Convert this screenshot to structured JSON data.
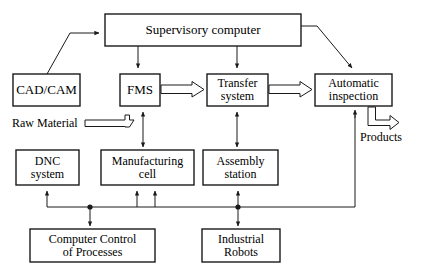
{
  "diagram": {
    "stroke_color": "#1a1a1a",
    "fill_color": "#ffffff",
    "nodes": [
      {
        "id": "supervisory",
        "label": "Supervisory computer",
        "x": 105,
        "y": 14,
        "w": 196,
        "h": 32,
        "font_size": 13
      },
      {
        "id": "cadcam",
        "label": "CAD/CAM",
        "x": 13,
        "y": 74,
        "w": 67,
        "h": 32,
        "font_size": 13
      },
      {
        "id": "fms",
        "label": "FMS",
        "x": 120,
        "y": 74,
        "w": 40,
        "h": 32,
        "font_size": 13
      },
      {
        "id": "transfer",
        "label": "Transfer\nsystem",
        "x": 207,
        "y": 74,
        "w": 61,
        "h": 32,
        "font_size": 12
      },
      {
        "id": "inspection",
        "label": "Automatic\ninspection",
        "x": 315,
        "y": 74,
        "w": 77,
        "h": 32,
        "font_size": 12
      },
      {
        "id": "dnc",
        "label": "DNC\nsystem",
        "x": 16,
        "y": 150,
        "w": 63,
        "h": 35,
        "font_size": 12
      },
      {
        "id": "mfgcell",
        "label": "Manufacturing\ncell",
        "x": 101,
        "y": 150,
        "w": 93,
        "h": 35,
        "font_size": 12
      },
      {
        "id": "assembly",
        "label": "Assembly\nstation",
        "x": 203,
        "y": 150,
        "w": 75,
        "h": 35,
        "font_size": 12
      },
      {
        "id": "ccp",
        "label": "Computer Control\nof Processes",
        "x": 30,
        "y": 229,
        "w": 125,
        "h": 33,
        "font_size": 12
      },
      {
        "id": "robots",
        "label": "Industrial\nRobots",
        "x": 202,
        "y": 229,
        "w": 78,
        "h": 33,
        "font_size": 12
      }
    ],
    "free_labels": [
      {
        "id": "raw-material",
        "text": "Raw Material",
        "x": 12,
        "y": 116,
        "font_size": 12
      },
      {
        "id": "products",
        "text": "Products",
        "x": 360,
        "y": 130,
        "font_size": 12
      }
    ],
    "flow_arrows": [
      {
        "id": "fms-to-transfer",
        "from": "fms",
        "to": "transfer"
      },
      {
        "id": "transfer-to-inspection",
        "from": "transfer",
        "to": "inspection"
      },
      {
        "id": "raw-material-to-fms",
        "from": "raw-material",
        "to": "fms"
      },
      {
        "id": "inspection-to-products",
        "from": "inspection",
        "to": "products"
      }
    ],
    "signal_links": [
      {
        "id": "cadcam-to-supervisory",
        "from": "cadcam",
        "to": "supervisory"
      },
      {
        "id": "supervisory-to-fms",
        "from": "supervisory",
        "to": "fms"
      },
      {
        "id": "supervisory-to-transfer",
        "from": "supervisory",
        "to": "transfer"
      },
      {
        "id": "supervisory-to-inspection",
        "from": "supervisory",
        "to": "inspection"
      },
      {
        "id": "fms-mfgcell",
        "from": "fms",
        "to": "mfgcell"
      },
      {
        "id": "transfer-assembly",
        "from": "transfer",
        "to": "assembly"
      },
      {
        "id": "inspection-to-bus",
        "from": "inspection",
        "to": "robots-bus"
      },
      {
        "id": "ccp-to-dnc",
        "from": "ccp",
        "to": "dnc"
      },
      {
        "id": "ccp-to-mfgcell",
        "from": "ccp",
        "to": "mfgcell"
      },
      {
        "id": "robots-to-mfgcell",
        "from": "robots",
        "to": "mfgcell"
      },
      {
        "id": "robots-to-assembly",
        "from": "robots",
        "to": "assembly"
      }
    ],
    "junction_dots": [
      {
        "id": "ccp-junction",
        "x": 90,
        "y": 207
      },
      {
        "id": "robots-junction",
        "x": 238,
        "y": 207
      }
    ]
  }
}
